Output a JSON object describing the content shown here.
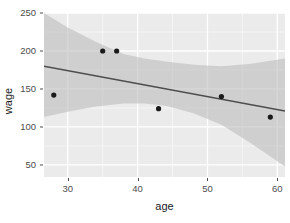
{
  "chart_data": {
    "type": "scatter",
    "title": "",
    "xlabel": "age",
    "ylabel": "wage",
    "xlim": [
      26.6,
      61.1
    ],
    "ylim": [
      34.1,
      250.0
    ],
    "xticks": [
      30,
      40,
      50,
      60
    ],
    "yticks": [
      50,
      100,
      150,
      200,
      250
    ],
    "grid": true,
    "legend": "none",
    "points": [
      {
        "x": 28,
        "y": 142
      },
      {
        "x": 35,
        "y": 200
      },
      {
        "x": 37,
        "y": 200
      },
      {
        "x": 43,
        "y": 124
      },
      {
        "x": 52,
        "y": 140
      },
      {
        "x": 59,
        "y": 113
      }
    ],
    "series": [
      {
        "name": "linear fit",
        "type": "line",
        "points": [
          {
            "x": 26.6,
            "y": 180
          },
          {
            "x": 61.1,
            "y": 121
          }
        ]
      },
      {
        "name": "confidence band",
        "type": "area",
        "upper": [
          {
            "x": 26.6,
            "y": 250
          },
          {
            "x": 30.0,
            "y": 231
          },
          {
            "x": 34.0,
            "y": 212
          },
          {
            "x": 38.0,
            "y": 196
          },
          {
            "x": 41.0,
            "y": 190
          },
          {
            "x": 44.0,
            "y": 186
          },
          {
            "x": 48.0,
            "y": 182
          },
          {
            "x": 52.0,
            "y": 180
          },
          {
            "x": 56.0,
            "y": 183
          },
          {
            "x": 61.1,
            "y": 190
          }
        ],
        "lower": [
          {
            "x": 26.6,
            "y": 113
          },
          {
            "x": 30.0,
            "y": 120
          },
          {
            "x": 34.0,
            "y": 127
          },
          {
            "x": 38.0,
            "y": 131
          },
          {
            "x": 41.0,
            "y": 131
          },
          {
            "x": 44.0,
            "y": 128
          },
          {
            "x": 48.0,
            "y": 118
          },
          {
            "x": 52.0,
            "y": 103
          },
          {
            "x": 56.0,
            "y": 80
          },
          {
            "x": 61.1,
            "y": 48
          }
        ]
      }
    ],
    "colors": {
      "panel_background": "#ebebeb",
      "grid_major": "#ffffff",
      "grid_minor": "#f5f5f5",
      "point_fill": "#1a1a1a",
      "line": "#4d4d4d",
      "band_fill": "#bfbfbf",
      "axis_text": "#4d4d4d",
      "axis_title": "#1a1a1a",
      "figure_background": "#ffffff"
    }
  },
  "axes": {
    "x": {
      "label": "age",
      "tick_labels": [
        "30",
        "40",
        "50",
        "60"
      ]
    },
    "y": {
      "label": "wage",
      "tick_labels": [
        "50",
        "100",
        "150",
        "200",
        "250"
      ]
    }
  }
}
